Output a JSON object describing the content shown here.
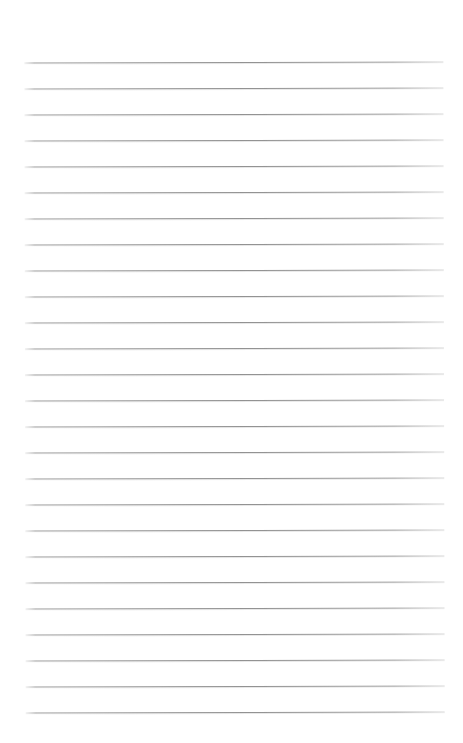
{
  "document": {
    "kind": "lined-paper",
    "title": "Blank ruled notebook page",
    "page_width": 463,
    "page_height": 743,
    "background_color": "#ffffff",
    "rule_color": "#8f8f8f",
    "rule_thickness": 1,
    "rule_count": 26,
    "first_rule_y": 62,
    "rule_spacing": 26,
    "rule_left_x": 25,
    "rule_right_x": 444,
    "top_margin": 62,
    "bottom_margin": 31,
    "rotation_deg": -0.12,
    "has_margin_rule": false,
    "has_holes": false,
    "text_content": ""
  },
  "rules": [
    {
      "index": 1,
      "y": 62
    },
    {
      "index": 2,
      "y": 88
    },
    {
      "index": 3,
      "y": 114
    },
    {
      "index": 4,
      "y": 140
    },
    {
      "index": 5,
      "y": 166
    },
    {
      "index": 6,
      "y": 192
    },
    {
      "index": 7,
      "y": 218
    },
    {
      "index": 8,
      "y": 244
    },
    {
      "index": 9,
      "y": 270
    },
    {
      "index": 10,
      "y": 296
    },
    {
      "index": 11,
      "y": 322
    },
    {
      "index": 12,
      "y": 348
    },
    {
      "index": 13,
      "y": 374
    },
    {
      "index": 14,
      "y": 400
    },
    {
      "index": 15,
      "y": 426
    },
    {
      "index": 16,
      "y": 452
    },
    {
      "index": 17,
      "y": 478
    },
    {
      "index": 18,
      "y": 504
    },
    {
      "index": 19,
      "y": 530
    },
    {
      "index": 20,
      "y": 556
    },
    {
      "index": 21,
      "y": 582
    },
    {
      "index": 22,
      "y": 608
    },
    {
      "index": 23,
      "y": 634
    },
    {
      "index": 24,
      "y": 660
    },
    {
      "index": 25,
      "y": 686
    },
    {
      "index": 26,
      "y": 712
    }
  ]
}
